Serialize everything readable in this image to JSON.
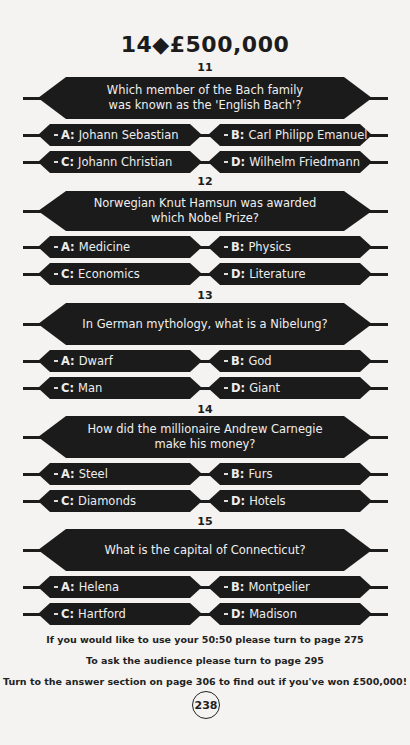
{
  "header": {
    "title": "14◆£500,000"
  },
  "questions": [
    {
      "number": "11",
      "text_lines": [
        "Which member of the Bach family",
        "was known as the 'English Bach'?"
      ],
      "answers": [
        {
          "letter": "A:",
          "text": "Johann Sebastian"
        },
        {
          "letter": "B:",
          "text": "Carl Philipp Emanuel"
        },
        {
          "letter": "C:",
          "text": "Johann Christian"
        },
        {
          "letter": "D:",
          "text": "Wilhelm Friedmann"
        }
      ]
    },
    {
      "number": "12",
      "text_lines": [
        "Norwegian Knut Hamsun was awarded which Nobel Prize?"
      ],
      "answers": [
        {
          "letter": "A:",
          "text": "Medicine"
        },
        {
          "letter": "B:",
          "text": "Physics"
        },
        {
          "letter": "C:",
          "text": "Economics"
        },
        {
          "letter": "D:",
          "text": "Literature"
        }
      ]
    },
    {
      "number": "13",
      "text_lines": [
        "In German mythology, what is a Nibelung?"
      ],
      "answers": [
        {
          "letter": "A:",
          "text": "Dwarf"
        },
        {
          "letter": "B:",
          "text": "God"
        },
        {
          "letter": "C:",
          "text": "Man"
        },
        {
          "letter": "D:",
          "text": "Giant"
        }
      ]
    },
    {
      "number": "14",
      "text_lines": [
        "How did the millionaire Andrew Carnegie make his money?"
      ],
      "answers": [
        {
          "letter": "A:",
          "text": "Steel"
        },
        {
          "letter": "B:",
          "text": "Furs"
        },
        {
          "letter": "C:",
          "text": "Diamonds"
        },
        {
          "letter": "D:",
          "text": "Hotels"
        }
      ]
    },
    {
      "number": "15",
      "text_lines": [
        "What is the capital of Connecticut?"
      ],
      "answers": [
        {
          "letter": "A:",
          "text": "Helena"
        },
        {
          "letter": "B:",
          "text": "Montpelier"
        },
        {
          "letter": "C:",
          "text": "Hartford"
        },
        {
          "letter": "D:",
          "text": "Madison"
        }
      ]
    }
  ],
  "footer": {
    "lines": [
      "If you would like to use your 50:50 please turn to page 275",
      "To ask the audience please turn to page 295",
      "Turn to the answer section on page 306 to find out if you've won £500,000!"
    ],
    "page_number": "238"
  }
}
